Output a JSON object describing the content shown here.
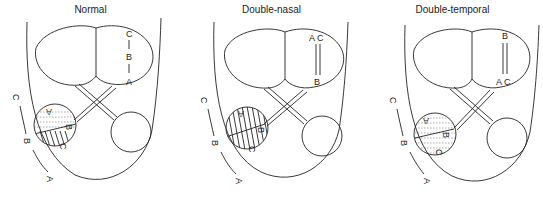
{
  "figure": {
    "panels": [
      {
        "id": "normal",
        "title": "Normal",
        "eye_labels": {
          "top": "C",
          "mid": "B",
          "bottom": "A"
        },
        "eye_label_layout": "single-line",
        "disc_labels": [
          "A",
          "B",
          "C"
        ],
        "disc_pattern": "dotted-top-hatched-bottom",
        "arc_labels": [
          "C",
          "B",
          "A"
        ]
      },
      {
        "id": "double-nasal",
        "title": "Double-nasal",
        "eye_labels": {
          "top": "A C",
          "bottom": "B"
        },
        "eye_label_layout": "double-line-top",
        "disc_labels": [
          "A",
          "B",
          "C"
        ],
        "disc_pattern": "hatched",
        "arc_labels": [
          "C",
          "B",
          "A"
        ]
      },
      {
        "id": "double-temporal",
        "title": "Double-temporal",
        "eye_labels": {
          "top": "B",
          "bottom": "A C"
        },
        "eye_label_layout": "double-line-bottom",
        "disc_labels": [
          "A",
          "B",
          "C"
        ],
        "disc_pattern": "dotted",
        "arc_labels": [
          "C",
          "B",
          "A"
        ]
      }
    ],
    "colors": {
      "line": "#222222",
      "background": "#ffffff"
    }
  }
}
